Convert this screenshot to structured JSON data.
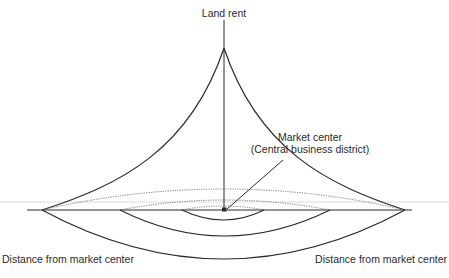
{
  "diagram": {
    "title_axis_label": "Land rent",
    "center_label_line1": "Market center",
    "center_label_line2": "(Central business district)",
    "left_axis_label": "Distance from market center",
    "right_axis_label": "Distance from market center",
    "colors": {
      "line": "#2b2b2b",
      "dotted": "#6a6a6a",
      "guide": "#cfcfcf",
      "background": "#ffffff"
    }
  }
}
